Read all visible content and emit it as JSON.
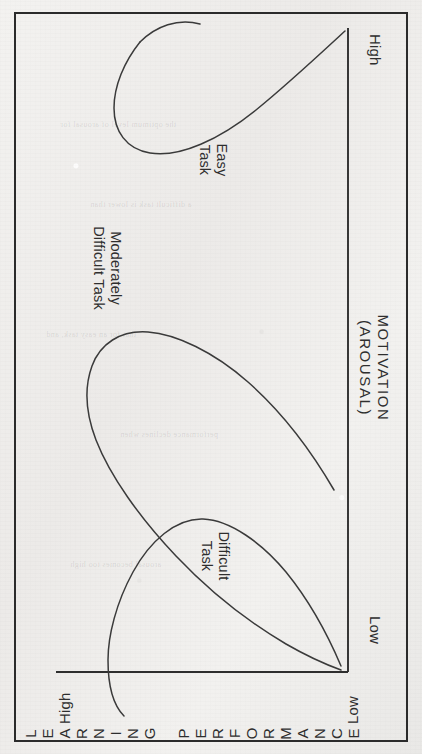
{
  "figure": {
    "orientation": "rotated-90-ccw",
    "background_color": "#efefed",
    "ink_color": "#2e2e2e",
    "frame_color": "#2b2b2b",
    "ghost_lines": [
      "the optimum level of arousal for",
      "a difficult task is lower than",
      "that for an easy task, and",
      "performance declines when",
      "arousal becomes too high"
    ]
  },
  "chart_data": {
    "type": "line",
    "title": "",
    "xlabel": "MOTIVATION (AROUSAL)",
    "ylabel": "LEARNING PERFORMANCE",
    "xlabel_line1": "MOTIVATION",
    "xlabel_line2": "(AROUSAL)",
    "x_tick_labels": [
      "Low",
      "High"
    ],
    "y_tick_labels": [
      "Low",
      "High"
    ],
    "xlim": [
      0,
      100
    ],
    "ylim": [
      0,
      100
    ],
    "grid": false,
    "legend": "inline-labels",
    "annotations": [
      "Difficult Task",
      "Moderately Difficult Task",
      "Easy Task"
    ],
    "series": [
      {
        "name": "Difficult Task",
        "label_line1": "Difficult",
        "label_line2": "Task",
        "peak_x": 24,
        "peak_y": 88,
        "x": [
          0,
          6,
          12,
          18,
          24,
          30,
          38,
          48,
          60,
          74,
          88,
          100
        ],
        "y": [
          6,
          26,
          55,
          78,
          88,
          83,
          66,
          45,
          30,
          19,
          12,
          8
        ]
      },
      {
        "name": "Moderately Difficult Task",
        "label_line1": "Moderately",
        "label_line2": "Difficult Task",
        "peak_x": 50,
        "peak_y": 86,
        "x": [
          0,
          8,
          18,
          28,
          38,
          46,
          54,
          64,
          74,
          84,
          92,
          100
        ],
        "y": [
          10,
          20,
          38,
          60,
          78,
          85,
          86,
          78,
          62,
          42,
          28,
          18
        ]
      },
      {
        "name": "Easy Task",
        "label_line1": "Easy",
        "label_line2": "Task",
        "peak_x": 78,
        "peak_y": 90,
        "x": [
          0,
          10,
          22,
          34,
          46,
          58,
          68,
          78,
          86,
          93,
          100
        ],
        "y": [
          12,
          18,
          26,
          36,
          50,
          66,
          79,
          90,
          92,
          88,
          80
        ]
      }
    ]
  },
  "axes": {
    "y_axis": {
      "name": "LEARNING PERFORMANCE",
      "letters": [
        "L",
        "E",
        "A",
        "R",
        "N",
        "I",
        "N",
        "G",
        "",
        "P",
        "E",
        "R",
        "F",
        "O",
        "R",
        "M",
        "A",
        "N",
        "C",
        "E"
      ],
      "low_label": "Low",
      "high_label": "High"
    },
    "x_axis": {
      "name": "MOTIVATION (AROUSAL)",
      "line1": "MOTIVATION",
      "line2": "(AROUSAL)",
      "low_label": "Low",
      "high_label": "High"
    }
  }
}
